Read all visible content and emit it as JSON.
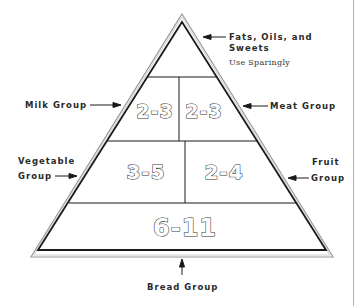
{
  "diagram": {
    "type": "food-pyramid",
    "tiers": [
      {
        "name": "Fats, Oils, and Sweets",
        "servings": "",
        "note": "Use Sparingly"
      },
      {
        "name": "Milk Group",
        "servings": "2-3"
      },
      {
        "name": "Meat Group",
        "servings": "2-3"
      },
      {
        "name": "Vegetable Group",
        "servings": "3-5"
      },
      {
        "name": "Fruit Group",
        "servings": "2-4"
      },
      {
        "name": "Bread Group",
        "servings": "6-11"
      }
    ]
  },
  "labels": {
    "fats_line1": "Fats, Oils, and",
    "fats_line2": "Sweets",
    "fats_note": "Use Sparingly",
    "milk": "Milk Group",
    "meat": "Meat Group",
    "vegetable_line1": "Vegetable",
    "vegetable_line2": "Group",
    "fruit_line1": "Fruit",
    "fruit_line2": "Group",
    "bread": "Bread Group"
  },
  "servings": {
    "milk": "2-3",
    "meat": "2-3",
    "vegetable": "3-5",
    "fruit": "2-4",
    "bread": "6-11"
  },
  "colors": {
    "line": "#1a1a1a",
    "outer_line": "#9a9a9a",
    "background": "#ffffff"
  }
}
